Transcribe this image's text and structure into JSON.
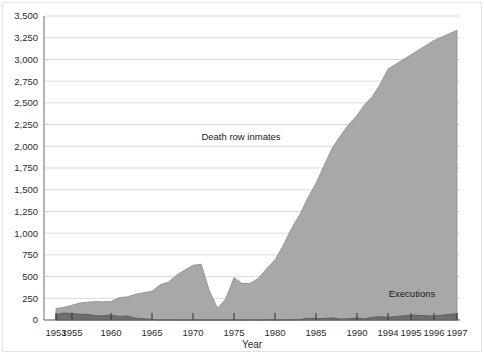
{
  "chart_data": {
    "type": "area",
    "title": "",
    "xlabel": "Year",
    "ylabel": "",
    "ylim": [
      0,
      3500
    ],
    "ytick_step": 250,
    "grid": true,
    "legend_position": "inline-annotation",
    "stacked": false,
    "y_ticks": [
      "0",
      "250",
      "500",
      "750",
      "1,000",
      "1,250",
      "1,500",
      "1,750",
      "2,000",
      "2,250",
      "2,500",
      "2,750",
      "3,000",
      "3,250",
      "3,500"
    ],
    "x_tick_labels": [
      "1953",
      "1955",
      "1960",
      "1965",
      "1970",
      "1975",
      "1980",
      "1985",
      "1990",
      "1994",
      "1995",
      "1996",
      "1997"
    ],
    "x_tick_years": [
      1953,
      1955,
      1960,
      1965,
      1970,
      1975,
      1980,
      1985,
      1990,
      1994,
      1995,
      1996,
      1997
    ],
    "x": [
      1953,
      1954,
      1955,
      1956,
      1957,
      1958,
      1959,
      1960,
      1961,
      1962,
      1963,
      1964,
      1965,
      1966,
      1967,
      1968,
      1969,
      1970,
      1971,
      1972,
      1973,
      1974,
      1975,
      1976,
      1977,
      1978,
      1979,
      1980,
      1981,
      1982,
      1983,
      1984,
      1985,
      1986,
      1987,
      1988,
      1989,
      1990,
      1991,
      1992,
      1993,
      1994,
      1995,
      1996,
      1997
    ],
    "series": [
      {
        "name": "Death row inmates",
        "color": "#a8a8a8",
        "values": [
          131,
          147,
          170,
          196,
          205,
          212,
          209,
          212,
          257,
          267,
          297,
          315,
          331,
          406,
          435,
          517,
          575,
          631,
          642,
          334,
          134,
          244,
          488,
          420,
          423,
          482,
          593,
          691,
          860,
          1050,
          1209,
          1405,
          1575,
          1781,
          1984,
          2124,
          2250,
          2356,
          2482,
          2575,
          2716,
          2890,
          3054,
          3219,
          3335
        ]
      },
      {
        "name": "Executions",
        "color": "#6e6e6e",
        "values": [
          62,
          81,
          76,
          65,
          65,
          49,
          49,
          56,
          42,
          47,
          21,
          15,
          7,
          1,
          2,
          0,
          0,
          0,
          0,
          0,
          0,
          0,
          0,
          0,
          1,
          0,
          2,
          0,
          1,
          2,
          5,
          21,
          18,
          18,
          25,
          11,
          16,
          23,
          14,
          31,
          38,
          31,
          56,
          45,
          74
        ]
      }
    ],
    "annotations": [
      {
        "text": "Death row inmates",
        "x_px": 241,
        "y_px": 140
      },
      {
        "text": "Executions",
        "x_px": 412,
        "y_px": 297
      }
    ]
  }
}
